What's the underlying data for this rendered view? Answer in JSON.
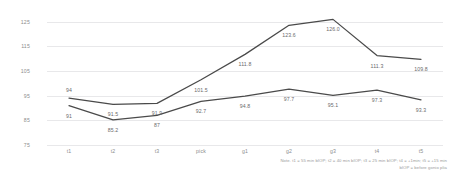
{
  "chart_data": {
    "type": "line",
    "title": "",
    "xlabel": "",
    "ylabel": "",
    "categories": [
      "t1",
      "t2",
      "t3",
      "pick",
      "g1",
      "g2",
      "g3",
      "t4",
      "t5"
    ],
    "series": [
      {
        "name": "upper",
        "values": [
          94,
          91.5,
          91.9,
          101.5,
          111.8,
          123.6,
          126.0,
          111.3,
          109.8
        ],
        "labels": [
          "94",
          "91.5",
          "91.9",
          "101.5",
          "111.8",
          "123.6",
          "126.0",
          "111.3",
          "109.8"
        ]
      },
      {
        "name": "lower",
        "values": [
          91,
          85.2,
          87,
          92.7,
          94.8,
          97.7,
          95.1,
          97.3,
          93.3
        ],
        "labels": [
          "91",
          "85.2",
          "87",
          "92.7",
          "94.8",
          "97.7",
          "95.1",
          "97.3",
          "93.3"
        ]
      }
    ],
    "yticks": [
      "125",
      "115",
      "105",
      "95",
      "85",
      "75"
    ],
    "ytick_values": [
      125,
      115,
      105,
      95,
      85,
      75
    ],
    "ylim": [
      75,
      129
    ],
    "grid": true,
    "legend": "none",
    "line_color": "#4a4a4a"
  },
  "footnote": {
    "line1": "Note. t1 = 55 min bIOP; t2 = 40 min bIOP; t3 = 25 min bIOP; t4 = +1min; t5 = +15 min",
    "line2": "bIOP = before gonio plia"
  }
}
